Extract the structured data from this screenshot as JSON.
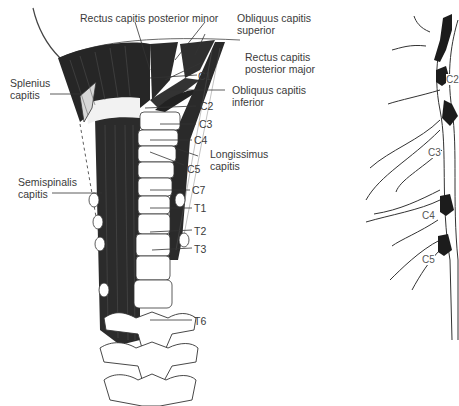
{
  "figure": {
    "left_panel": {
      "title": "Posterior neck musculature and cervicothoracic spine",
      "labels": {
        "rcpm": "Rectus capitis posterior minor",
        "ocs_1": "Obliquus capitis",
        "ocs_2": "superior",
        "splenius_1": "Splenius",
        "splenius_2": "capitis",
        "rcpmaj_1": "Rectus capitis",
        "rcpmaj_2": "posterior major",
        "oci_1": "Obliquus capitis",
        "oci_2": "inferior",
        "longissimus_1": "Longissimus",
        "longissimus_2": "capitis",
        "semispinalis_1": "Semispinalis",
        "semispinalis_2": "capitis",
        "c1": "C1",
        "c2": "C2",
        "c3": "C3",
        "c4": "C4",
        "c5": "C5",
        "c7": "C7",
        "t1": "T1",
        "t2": "T2",
        "t3": "T3",
        "t6": "T6"
      }
    },
    "right_panel": {
      "title": "Cervical nerve roots",
      "labels": {
        "c2": "C2",
        "c3": "C3",
        "c4": "C4",
        "c5": "C5"
      }
    }
  }
}
